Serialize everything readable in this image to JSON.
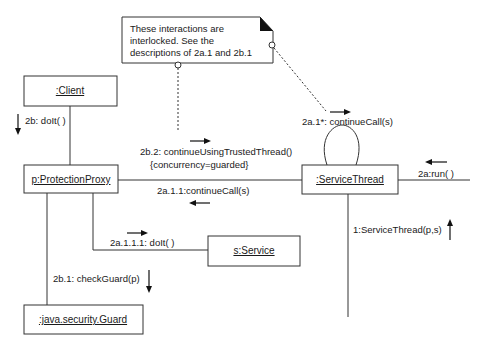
{
  "diagram": {
    "type": "UML collaboration diagram",
    "note": {
      "lines": [
        "These interactions are",
        "interlocked.  See the",
        "descriptions of 2a.1 and 2b.1"
      ]
    },
    "objects": {
      "client": ":Client",
      "proxy": "p:ProtectionProxy",
      "service_thread": ":ServiceThread",
      "service": "s:Service",
      "guard": ":java.security.Guard"
    },
    "messages": {
      "do_it_2b": "2b: doIt( )",
      "continue_trusted": "2b.2: continueUsingTrustedThread()",
      "concurrency": "{concurrency=guarded}",
      "continue_call_2a11": "2a.1.1:continueCall(s)",
      "continue_call_2a1": "2a.1*: continueCall(s)",
      "run_2a": "2a:run( )",
      "do_it_2a111": "2a.1.1.1: doIt( )",
      "service_thread_ctor": "1:ServiceThread(p,s)",
      "check_guard": "2b.1: checkGuard(p)"
    },
    "colors": {
      "line": "#333333",
      "text": "#1a1a1a",
      "background": "#ffffff"
    }
  }
}
